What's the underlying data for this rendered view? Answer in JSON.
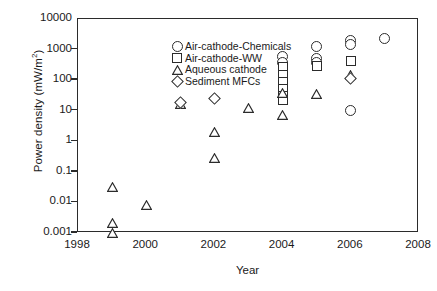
{
  "chart_data": {
    "type": "scatter",
    "title": "",
    "xlabel": "Year",
    "ylabel": "Power density (mW/m2)",
    "ylabel_base": "Power density (mW/m",
    "ylabel_sup": "2",
    "ylabel_tail": ")",
    "yscale": "log",
    "xlim": [
      1998,
      2008
    ],
    "ylim": [
      0.001,
      10000
    ],
    "grid": false,
    "legend_position": "upper-left-inside",
    "xticks": [
      "1998",
      "2000",
      "2002",
      "2004",
      "2006",
      "2008"
    ],
    "xtick_values": [
      1998,
      2000,
      2002,
      2004,
      2006,
      2008
    ],
    "yticks": [
      "10000",
      "1000",
      "100",
      "10",
      "1",
      "0.1",
      "0.01",
      "0.001"
    ],
    "ytick_values": [
      10000,
      1000,
      100,
      10,
      1,
      0.1,
      0.01,
      0.001
    ],
    "series": [
      {
        "name": "Air-cathode-Chemicals",
        "marker": "circle",
        "points": [
          {
            "x": 2004,
            "y": 600
          },
          {
            "x": 2004,
            "y": 380
          },
          {
            "x": 2005,
            "y": 1300
          },
          {
            "x": 2005,
            "y": 520
          },
          {
            "x": 2005,
            "y": 380
          },
          {
            "x": 2006,
            "y": 2000
          },
          {
            "x": 2006,
            "y": 1500
          },
          {
            "x": 2006,
            "y": 10
          },
          {
            "x": 2007,
            "y": 2300
          }
        ]
      },
      {
        "name": "Air-cathode-WW",
        "marker": "square",
        "points": [
          {
            "x": 2004,
            "y": 260
          },
          {
            "x": 2004,
            "y": 150
          },
          {
            "x": 2004,
            "y": 90
          },
          {
            "x": 2004,
            "y": 50
          },
          {
            "x": 2004,
            "y": 30
          },
          {
            "x": 2004,
            "y": 22
          },
          {
            "x": 2005,
            "y": 300
          },
          {
            "x": 2006,
            "y": 420
          }
        ]
      },
      {
        "name": "Aqueous cathode",
        "marker": "triangle",
        "points": [
          {
            "x": 1999,
            "y": 0.032
          },
          {
            "x": 1999,
            "y": 0.0022
          },
          {
            "x": 1999,
            "y": 0.001
          },
          {
            "x": 2000,
            "y": 0.0085
          },
          {
            "x": 2001,
            "y": 16
          },
          {
            "x": 2002,
            "y": 2.0
          },
          {
            "x": 2002,
            "y": 0.28
          },
          {
            "x": 2003,
            "y": 12
          },
          {
            "x": 2004,
            "y": 38
          },
          {
            "x": 2004,
            "y": 7
          },
          {
            "x": 2005,
            "y": 36
          },
          {
            "x": 2006,
            "y": 150
          }
        ]
      },
      {
        "name": "Sediment MFCs",
        "marker": "diamond",
        "points": [
          {
            "x": 2001,
            "y": 18
          },
          {
            "x": 2002,
            "y": 26
          },
          {
            "x": 2006,
            "y": 110
          }
        ]
      }
    ]
  }
}
